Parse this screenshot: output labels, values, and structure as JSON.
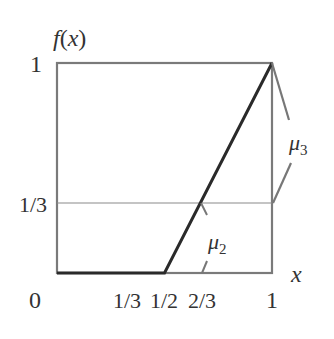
{
  "diagram": {
    "y_axis_label": "f(x)",
    "x_axis_label": "x",
    "y_ticks": [
      {
        "label": "1",
        "value": 1
      },
      {
        "label": "1/3",
        "value": 0.3333
      }
    ],
    "x_ticks": [
      {
        "label": "0",
        "value": 0
      },
      {
        "label": "1/3",
        "value": 0.3333
      },
      {
        "label": "1/2",
        "value": 0.5
      },
      {
        "label": "2/3",
        "value": 0.6667
      },
      {
        "label": "1",
        "value": 1
      }
    ],
    "annotations": {
      "mu2": {
        "symbol": "μ",
        "subscript": "2"
      },
      "mu3": {
        "symbol": "μ",
        "subscript": "3"
      }
    },
    "function": {
      "description": "f(x)=0 on [0,1/2], linear from (1/2,0) to (1,1)",
      "points": [
        [
          0,
          0
        ],
        [
          0.5,
          0
        ],
        [
          1,
          1
        ]
      ]
    },
    "reference_line": {
      "y": 0.3333
    },
    "colors": {
      "frame": "#777777",
      "curve": "#2a2a2a",
      "text": "#333333",
      "reference": "#888888"
    }
  }
}
